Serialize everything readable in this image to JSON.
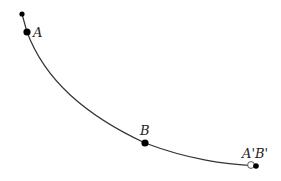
{
  "diagram": {
    "colors": {
      "curve": "#333333",
      "point": "#000000",
      "background": "#ffffff"
    },
    "points": [
      {
        "id": "start",
        "label": ""
      },
      {
        "id": "A",
        "label": "A"
      },
      {
        "id": "B",
        "label": "B"
      },
      {
        "id": "end",
        "label": "A'B'"
      }
    ]
  }
}
